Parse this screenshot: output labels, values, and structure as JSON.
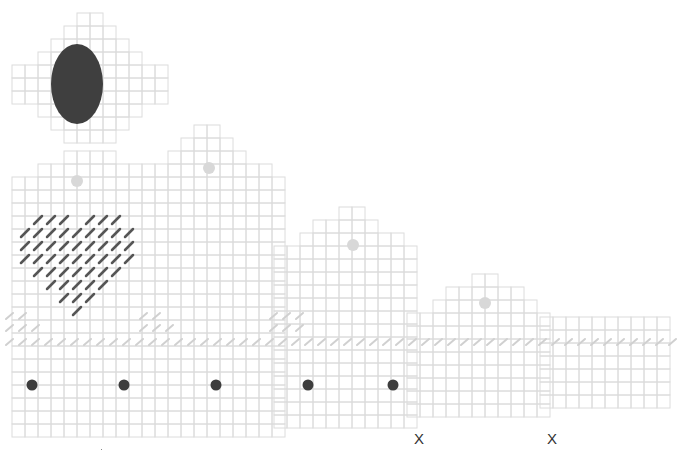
{
  "diagram": {
    "type": "plastic-canvas-needlepoint-pattern",
    "cell_size": 13,
    "colors": {
      "grid": "#dcdcdc",
      "grid_bold": "#cfcfcf",
      "oval": "#3f3f3f",
      "dark_dot": "#3d3d3d",
      "light_dot": "#d8d8d8",
      "dark_stitch": "#555555",
      "light_stitch": "#d0d0d0",
      "label": "#333333"
    },
    "pieces": [
      {
        "name": "top-oval-piece",
        "origin": [
          12,
          13
        ],
        "rows": [
          [
            5,
            7
          ],
          [
            4,
            8
          ],
          [
            3,
            9
          ],
          [
            2,
            10
          ],
          [
            0,
            12
          ],
          [
            0,
            12
          ],
          [
            0,
            12
          ],
          [
            2,
            10
          ],
          [
            3,
            9
          ],
          [
            4,
            8
          ]
        ],
        "oval": {
          "cx": 77,
          "cy": 84,
          "rx": 26,
          "ry": 40
        }
      },
      {
        "name": "heart-piece",
        "origin": [
          12,
          151
        ],
        "rows": [
          [
            4,
            8
          ],
          [
            2,
            10
          ],
          [
            0,
            10
          ],
          [
            0,
            10
          ],
          [
            0,
            10
          ],
          [
            0,
            10
          ],
          [
            0,
            10
          ],
          [
            0,
            10
          ],
          [
            0,
            10
          ],
          [
            0,
            10
          ],
          [
            0,
            10
          ],
          [
            0,
            10
          ],
          [
            0,
            10
          ],
          [
            0,
            10
          ],
          [
            0,
            10
          ],
          [
            0,
            10
          ],
          [
            0,
            10
          ],
          [
            0,
            10
          ],
          [
            0,
            10
          ],
          [
            0,
            10
          ],
          [
            0,
            10
          ],
          [
            0,
            10
          ]
        ],
        "light_dot": {
          "cx": 77,
          "cy": 181
        }
      },
      {
        "name": "tall-house-piece-1",
        "origin": [
          142,
          125
        ],
        "rows": [
          [
            4,
            6
          ],
          [
            3,
            7
          ],
          [
            2,
            8
          ],
          [
            0,
            10
          ],
          [
            0,
            11
          ],
          [
            0,
            11
          ],
          [
            0,
            11
          ],
          [
            0,
            11
          ],
          [
            0,
            11
          ],
          [
            0,
            11
          ],
          [
            0,
            11
          ],
          [
            0,
            11
          ],
          [
            0,
            11
          ],
          [
            0,
            11
          ],
          [
            0,
            11
          ],
          [
            0,
            11
          ],
          [
            0,
            11
          ],
          [
            0,
            11
          ],
          [
            0,
            11
          ],
          [
            0,
            11
          ],
          [
            0,
            11
          ],
          [
            0,
            11
          ],
          [
            0,
            11
          ],
          [
            0,
            11
          ]
        ],
        "light_dot": {
          "cx": 209,
          "cy": 168
        }
      },
      {
        "name": "house-piece-2",
        "origin": [
          274,
          207
        ],
        "rows": [
          [
            5,
            7
          ],
          [
            3,
            8
          ],
          [
            2,
            10
          ],
          [
            0,
            11
          ],
          [
            0,
            11
          ],
          [
            0,
            11
          ],
          [
            0,
            11
          ],
          [
            0,
            11
          ],
          [
            0,
            11
          ],
          [
            0,
            11
          ],
          [
            0,
            11
          ],
          [
            0,
            11
          ],
          [
            0,
            11
          ],
          [
            0,
            11
          ],
          [
            0,
            11
          ],
          [
            0,
            11
          ],
          [
            0,
            11
          ]
        ],
        "light_dot": {
          "cx": 353,
          "cy": 245
        }
      },
      {
        "name": "house-piece-3",
        "origin": [
          407,
          274
        ],
        "rows": [
          [
            5,
            7
          ],
          [
            3,
            9
          ],
          [
            2,
            10
          ],
          [
            0,
            11
          ],
          [
            0,
            11
          ],
          [
            0,
            11
          ],
          [
            0,
            11
          ],
          [
            0,
            11
          ],
          [
            0,
            11
          ],
          [
            0,
            11
          ],
          [
            0,
            11
          ]
        ],
        "light_dot": {
          "cx": 485,
          "cy": 303
        }
      },
      {
        "name": "base-strip-piece",
        "origin": [
          540,
          317
        ],
        "rows": [
          [
            0,
            10
          ],
          [
            0,
            10
          ],
          [
            0,
            10
          ],
          [
            0,
            10
          ],
          [
            0,
            10
          ],
          [
            0,
            10
          ],
          [
            0,
            10
          ]
        ]
      }
    ],
    "dark_dots": [
      {
        "cx": 32,
        "cy": 385
      },
      {
        "cx": 124,
        "cy": 385
      },
      {
        "cx": 216,
        "cy": 385
      },
      {
        "cx": 308,
        "cy": 385
      },
      {
        "cx": 393,
        "cy": 385
      }
    ],
    "heart_stitches": {
      "rows": [
        {
          "y": 220,
          "xs": [
            38,
            51,
            64,
            90,
            103,
            116
          ]
        },
        {
          "y": 233,
          "xs": [
            25,
            38,
            51,
            64,
            77,
            90,
            103,
            116,
            129
          ]
        },
        {
          "y": 246,
          "xs": [
            25,
            38,
            51,
            64,
            77,
            90,
            103,
            116,
            129
          ]
        },
        {
          "y": 259,
          "xs": [
            25,
            38,
            51,
            64,
            77,
            90,
            103,
            116,
            129
          ]
        },
        {
          "y": 272,
          "xs": [
            38,
            51,
            64,
            77,
            90,
            103,
            116
          ]
        },
        {
          "y": 285,
          "xs": [
            51,
            64,
            77,
            90,
            103
          ]
        },
        {
          "y": 298,
          "xs": [
            64,
            77,
            90
          ]
        },
        {
          "y": 311,
          "xs": [
            77
          ]
        }
      ]
    },
    "light_stitch_rows": [
      {
        "y": 342,
        "x_start": 6,
        "x_end": 670
      },
      {
        "y": 328,
        "x_start": 6,
        "x_end": 40
      },
      {
        "y": 316,
        "x_start": 6,
        "x_end": 30
      },
      {
        "y": 328,
        "x_start": 140,
        "x_end": 175
      },
      {
        "y": 316,
        "x_start": 140,
        "x_end": 165
      },
      {
        "y": 328,
        "x_start": 270,
        "x_end": 305
      },
      {
        "y": 316,
        "x_start": 270,
        "x_end": 300
      }
    ],
    "labels": [
      {
        "text": "X",
        "x": 414,
        "y": 430
      },
      {
        "text": "X",
        "x": 547,
        "y": 430
      }
    ]
  }
}
